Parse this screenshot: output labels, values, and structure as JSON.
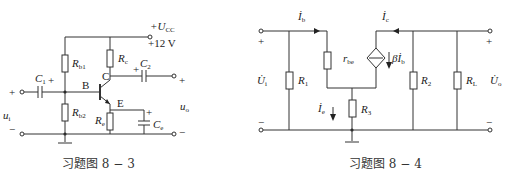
{
  "figures": [
    {
      "id": "fig-8-3",
      "caption": "习题图 8 − 3",
      "labels": {
        "supply": "+U",
        "supply_sub": "CC",
        "supply_value": "+12 V",
        "rb1": "R",
        "rb1_sub": "b1",
        "rb2": "R",
        "rb2_sub": "b2",
        "rc": "R",
        "rc_sub": "c",
        "re": "R",
        "re_sub": "e",
        "c1": "C",
        "c1_sub": "1",
        "c2": "C",
        "c2_sub": "2",
        "ce": "C",
        "ce_sub": "e",
        "node_b": "B",
        "node_c": "C",
        "node_e": "E",
        "ui": "u",
        "ui_sub": "i",
        "uo": "u",
        "uo_sub": "o",
        "plus": "+",
        "minus": "−"
      }
    },
    {
      "id": "fig-8-4",
      "caption": "习题图 8 − 4",
      "labels": {
        "ib": "İ",
        "ib_sub": "b",
        "ic": "İ",
        "ic_sub": "c",
        "ie": "İ",
        "ie_sub": "e",
        "rbe": "r",
        "rbe_sub": "be",
        "beta_ib": "βİ",
        "beta_ib_sub": "b",
        "r1": "R",
        "r1_sub": "1",
        "r2": "R",
        "r2_sub": "2",
        "r3": "R",
        "r3_sub": "3",
        "rl": "R",
        "rl_sub": "L",
        "ui": "U̇",
        "ui_sub": "i",
        "uo": "U̇",
        "uo_sub": "o",
        "plus": "+",
        "minus": "−"
      }
    }
  ]
}
